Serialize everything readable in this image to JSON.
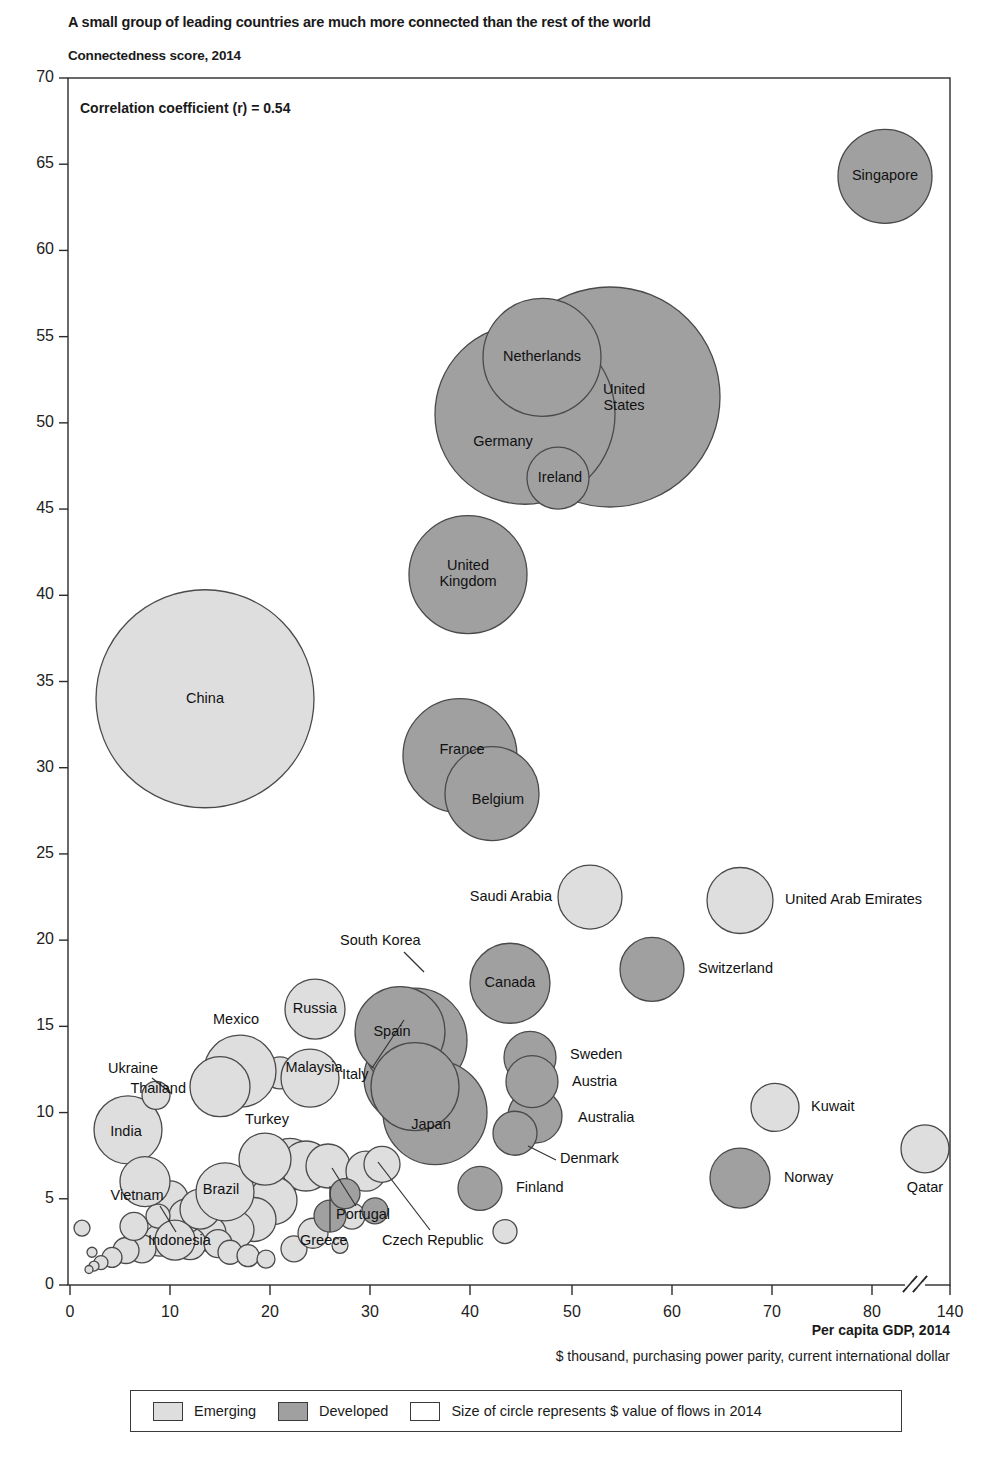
{
  "header": {
    "title": "A small group of leading countries are much more connected than the rest of the world",
    "subtitle": "Connectedness score, 2014"
  },
  "annotation": "Correlation coefficient (r) = 0.54",
  "axes": {
    "x_label": "Per capita GDP, 2014",
    "x_sublabel": "$ thousand, purchasing power parity, current international dollar",
    "y_ticks": [
      "0",
      "5",
      "10",
      "15",
      "20",
      "25",
      "30",
      "35",
      "40",
      "45",
      "50",
      "55",
      "60",
      "65",
      "70"
    ],
    "x_ticks": [
      "0",
      "10",
      "20",
      "30",
      "40",
      "50",
      "60",
      "70",
      "80",
      "140"
    ]
  },
  "legend": {
    "items": [
      {
        "label": "Emerging",
        "color": "#dedede"
      },
      {
        "label": "Developed",
        "color": "#a0a0a0"
      },
      {
        "label": "Size of circle represents $ value of flows in 2014",
        "color": "#ffffff"
      }
    ]
  },
  "colors": {
    "emerging": "#dedede",
    "developed": "#a0a0a0",
    "stroke": "#4a4a4a",
    "axis": "#2b2b2b"
  },
  "chart_data": {
    "type": "scatter",
    "title": "A small group of leading countries are much more connected than the rest of the world",
    "subtitle": "Connectedness score, 2014",
    "xlabel": "Per capita GDP, 2014",
    "xlabel_sub": "$ thousand, purchasing power parity, current international dollar",
    "ylabel": "Connectedness score, 2014",
    "xlim": [
      0,
      90
    ],
    "ylim": [
      0,
      70
    ],
    "x_axis_break": true,
    "x_break_note": "axis breaks between 80 and 140",
    "grid": false,
    "correlation_coefficient": 0.54,
    "legend_position": "bottom",
    "size_encoding": "Size of circle represents $ value of flows in 2014",
    "points": [
      {
        "name": "Singapore",
        "x": 81.5,
        "y": 64.3,
        "r": 47,
        "group": "Developed",
        "label": "inside"
      },
      {
        "name": "United States",
        "x": 54.0,
        "y": 51.5,
        "r": 110,
        "group": "Developed",
        "label": "inside2"
      },
      {
        "name": "Netherlands",
        "x": 47.2,
        "y": 53.8,
        "r": 59,
        "group": "Developed",
        "label": "inside"
      },
      {
        "name": "Germany",
        "x": 45.5,
        "y": 50.5,
        "r": 90,
        "group": "Developed",
        "label": "inside"
      },
      {
        "name": "Ireland",
        "x": 48.8,
        "y": 46.8,
        "r": 31,
        "group": "Developed",
        "label": "inside"
      },
      {
        "name": "United Kingdom",
        "x": 39.8,
        "y": 41.2,
        "r": 59,
        "group": "Developed",
        "label": "inside2"
      },
      {
        "name": "China",
        "x": 13.5,
        "y": 34.0,
        "r": 109,
        "group": "Emerging",
        "label": "inside"
      },
      {
        "name": "France",
        "x": 39.0,
        "y": 30.7,
        "r": 57,
        "group": "Developed",
        "label": "inside"
      },
      {
        "name": "Belgium",
        "x": 42.2,
        "y": 28.5,
        "r": 47,
        "group": "Developed",
        "label": "inside"
      },
      {
        "name": "Saudi Arabia",
        "x": 52.0,
        "y": 22.5,
        "r": 32,
        "group": "Emerging",
        "label": "left"
      },
      {
        "name": "United Arab Emirates",
        "x": 67.0,
        "y": 22.3,
        "r": 33,
        "group": "Emerging",
        "label": "right"
      },
      {
        "name": "Switzerland",
        "x": 58.2,
        "y": 18.3,
        "r": 32,
        "group": "Developed",
        "label": "right"
      },
      {
        "name": "Canada",
        "x": 44.0,
        "y": 17.5,
        "r": 40,
        "group": "Developed",
        "label": "inside"
      },
      {
        "name": "South Korea",
        "x": 34.5,
        "y": 14.2,
        "r": 52,
        "group": "Developed",
        "label": "leader-up"
      },
      {
        "name": "Spain",
        "x": 33.0,
        "y": 14.7,
        "r": 45,
        "group": "Developed",
        "label": "inside"
      },
      {
        "name": "Russia",
        "x": 24.5,
        "y": 16.0,
        "r": 30,
        "group": "Emerging",
        "label": "inside"
      },
      {
        "name": "Sweden",
        "x": 46.0,
        "y": 13.2,
        "r": 26,
        "group": "Developed",
        "label": "right"
      },
      {
        "name": "Austria",
        "x": 46.2,
        "y": 11.8,
        "r": 26,
        "group": "Developed",
        "label": "right"
      },
      {
        "name": "Australia",
        "x": 46.5,
        "y": 9.8,
        "r": 27,
        "group": "Developed",
        "label": "right"
      },
      {
        "name": "Denmark",
        "x": 44.5,
        "y": 8.8,
        "r": 22,
        "group": "Developed",
        "label": "leader-right"
      },
      {
        "name": "Japan",
        "x": 36.5,
        "y": 10.0,
        "r": 52,
        "group": "Developed",
        "label": "inside"
      },
      {
        "name": "Italy",
        "x": 34.5,
        "y": 11.5,
        "r": 44,
        "group": "Developed",
        "label": "leader-left"
      },
      {
        "name": "Mexico",
        "x": 17.0,
        "y": 12.4,
        "r": 36,
        "group": "Emerging",
        "label": "above"
      },
      {
        "name": "Thailand",
        "x": 15.0,
        "y": 11.5,
        "r": 30,
        "group": "Emerging",
        "label": "left"
      },
      {
        "name": "Malaysia",
        "x": 24.0,
        "y": 12.0,
        "r": 29,
        "group": "Emerging",
        "label": "inside"
      },
      {
        "name": "Ukraine",
        "x": 8.6,
        "y": 11.0,
        "r": 14,
        "group": "Emerging",
        "label": "leader-left"
      },
      {
        "name": "India",
        "x": 5.8,
        "y": 9.0,
        "r": 34,
        "group": "Emerging",
        "label": "inside"
      },
      {
        "name": "Turkey",
        "x": 19.5,
        "y": 7.3,
        "r": 26,
        "group": "Emerging",
        "label": "above"
      },
      {
        "name": "Vietnam",
        "x": 7.5,
        "y": 6.0,
        "r": 25,
        "group": "Emerging",
        "label": "inside"
      },
      {
        "name": "Brazil",
        "x": 15.5,
        "y": 5.4,
        "r": 29,
        "group": "Emerging",
        "label": "inside"
      },
      {
        "name": "Finland",
        "x": 41.0,
        "y": 5.6,
        "r": 22,
        "group": "Developed",
        "label": "right"
      },
      {
        "name": "Indonesia",
        "x": 10.5,
        "y": 2.6,
        "r": 20,
        "group": "Emerging",
        "label": "leader-below"
      },
      {
        "name": "Greece",
        "x": 26.0,
        "y": 4.0,
        "r": 16,
        "group": "Developed",
        "label": "leader-below"
      },
      {
        "name": "Portugal",
        "x": 27.5,
        "y": 5.3,
        "r": 15,
        "group": "Developed",
        "label": "leader-below"
      },
      {
        "name": "Czech Republic",
        "x": 30.5,
        "y": 4.3,
        "r": 13,
        "group": "Developed",
        "label": "leader-below"
      },
      {
        "name": "Kuwait",
        "x": 70.5,
        "y": 10.3,
        "r": 24,
        "group": "Emerging",
        "label": "right"
      },
      {
        "name": "Norway",
        "x": 67.0,
        "y": 6.2,
        "r": 30,
        "group": "Developed",
        "label": "right"
      },
      {
        "name": "Qatar",
        "x": 85.5,
        "y": 7.9,
        "r": 24,
        "group": "Emerging",
        "label": "below"
      }
    ],
    "unlabeled_points": [
      {
        "x": 21.0,
        "y": 12.3,
        "r": 16,
        "group": "Emerging"
      },
      {
        "x": 22.0,
        "y": 7.0,
        "r": 26,
        "group": "Emerging"
      },
      {
        "x": 23.6,
        "y": 6.9,
        "r": 25,
        "group": "Emerging"
      },
      {
        "x": 25.8,
        "y": 6.9,
        "r": 22,
        "group": "Emerging"
      },
      {
        "x": 20.3,
        "y": 4.9,
        "r": 24,
        "group": "Emerging"
      },
      {
        "x": 18.4,
        "y": 3.8,
        "r": 22,
        "group": "Emerging"
      },
      {
        "x": 16.5,
        "y": 3.2,
        "r": 19,
        "group": "Emerging"
      },
      {
        "x": 13.8,
        "y": 3.0,
        "r": 18,
        "group": "Emerging"
      },
      {
        "x": 12.0,
        "y": 2.4,
        "r": 16,
        "group": "Emerging"
      },
      {
        "x": 9.0,
        "y": 2.6,
        "r": 16,
        "group": "Emerging"
      },
      {
        "x": 7.2,
        "y": 2.1,
        "r": 14,
        "group": "Emerging"
      },
      {
        "x": 5.6,
        "y": 2.0,
        "r": 13,
        "group": "Emerging"
      },
      {
        "x": 4.2,
        "y": 1.6,
        "r": 10,
        "group": "Emerging"
      },
      {
        "x": 3.1,
        "y": 1.3,
        "r": 7,
        "group": "Emerging"
      },
      {
        "x": 2.4,
        "y": 1.1,
        "r": 5,
        "group": "Emerging"
      },
      {
        "x": 1.9,
        "y": 0.9,
        "r": 4,
        "group": "Emerging"
      },
      {
        "x": 1.2,
        "y": 3.3,
        "r": 8,
        "group": "Emerging"
      },
      {
        "x": 2.2,
        "y": 1.9,
        "r": 5,
        "group": "Emerging"
      },
      {
        "x": 10.0,
        "y": 5.0,
        "r": 18,
        "group": "Emerging"
      },
      {
        "x": 11.6,
        "y": 4.0,
        "r": 17,
        "group": "Emerging"
      },
      {
        "x": 13.0,
        "y": 4.4,
        "r": 20,
        "group": "Emerging"
      },
      {
        "x": 14.8,
        "y": 2.4,
        "r": 14,
        "group": "Emerging"
      },
      {
        "x": 16.0,
        "y": 1.9,
        "r": 12,
        "group": "Emerging"
      },
      {
        "x": 17.8,
        "y": 1.7,
        "r": 11,
        "group": "Emerging"
      },
      {
        "x": 19.6,
        "y": 1.5,
        "r": 9,
        "group": "Emerging"
      },
      {
        "x": 22.4,
        "y": 2.1,
        "r": 13,
        "group": "Emerging"
      },
      {
        "x": 24.3,
        "y": 3.0,
        "r": 15,
        "group": "Emerging"
      },
      {
        "x": 27.0,
        "y": 2.3,
        "r": 8,
        "group": "Emerging"
      },
      {
        "x": 28.2,
        "y": 4.0,
        "r": 13,
        "group": "Emerging"
      },
      {
        "x": 29.6,
        "y": 6.6,
        "r": 20,
        "group": "Emerging"
      },
      {
        "x": 31.2,
        "y": 7.0,
        "r": 18,
        "group": "Emerging"
      },
      {
        "x": 43.5,
        "y": 3.1,
        "r": 12,
        "group": "Emerging"
      },
      {
        "x": 34.0,
        "y": 12.0,
        "r": 46,
        "group": "Developed"
      },
      {
        "x": 8.8,
        "y": 4.0,
        "r": 12,
        "group": "Emerging"
      },
      {
        "x": 6.4,
        "y": 3.4,
        "r": 14,
        "group": "Emerging"
      }
    ]
  }
}
